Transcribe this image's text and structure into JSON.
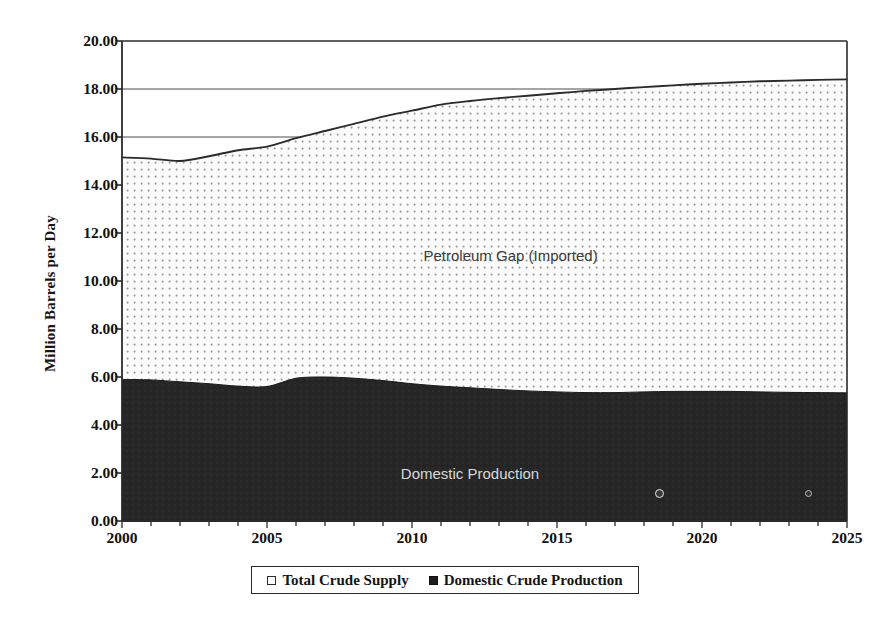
{
  "chart_data": {
    "type": "area",
    "title": "",
    "xlabel": "",
    "ylabel": "Million Barrels per Day",
    "xlim": [
      2000,
      2025
    ],
    "ylim": [
      0,
      20
    ],
    "grid": true,
    "legend_position": "bottom",
    "x_ticks": [
      "2000",
      "2005",
      "2010",
      "2015",
      "2020",
      "2025"
    ],
    "y_ticks": [
      "0.00",
      "2.00",
      "4.00",
      "6.00",
      "8.00",
      "10.00",
      "12.00",
      "14.00",
      "16.00",
      "18.00",
      "20.00"
    ],
    "x": [
      2000,
      2001,
      2002,
      2003,
      2004,
      2005,
      2006,
      2007,
      2008,
      2009,
      2010,
      2011,
      2012,
      2013,
      2014,
      2015,
      2016,
      2017,
      2018,
      2019,
      2020,
      2021,
      2022,
      2023,
      2024,
      2025
    ],
    "series": [
      {
        "name": "Total Crude Supply",
        "fill": "dotted-light",
        "values": [
          15.15,
          15.1,
          15.0,
          15.2,
          15.45,
          15.6,
          15.95,
          16.25,
          16.55,
          16.85,
          17.1,
          17.35,
          17.5,
          17.62,
          17.72,
          17.82,
          17.92,
          18.0,
          18.08,
          18.15,
          18.22,
          18.27,
          18.32,
          18.35,
          18.38,
          18.4
        ]
      },
      {
        "name": "Domestic Crude Production",
        "fill": "solid-dark",
        "values": [
          5.9,
          5.88,
          5.8,
          5.72,
          5.62,
          5.6,
          5.95,
          6.0,
          5.95,
          5.85,
          5.72,
          5.62,
          5.55,
          5.48,
          5.42,
          5.38,
          5.35,
          5.35,
          5.38,
          5.4,
          5.4,
          5.4,
          5.38,
          5.36,
          5.35,
          5.34
        ]
      }
    ],
    "annotations": [
      {
        "text": "Petroleum Gap (Imported)",
        "x": 2013.4,
        "y": 11.1
      },
      {
        "text": "Domestic Production",
        "x": 2012.0,
        "y": 2.0
      }
    ]
  },
  "legend": {
    "entries": [
      {
        "label": "Total Crude Supply",
        "swatch": "open-square-icon"
      },
      {
        "label": "Domestic Crude Production",
        "swatch": "filled-square-icon"
      }
    ]
  },
  "axes": {
    "y_title": "Million Barrels per Day"
  },
  "colors": {
    "axis": "#2a2a2a",
    "gridline": "#4a4a4a",
    "total_supply_fill": "#f4f4f4",
    "total_supply_line": "#2b2b2b",
    "domestic_fill": "#262626",
    "domestic_label": "#d8d8d8",
    "gap_label": "#3b3b3b",
    "background": "#ffffff"
  }
}
